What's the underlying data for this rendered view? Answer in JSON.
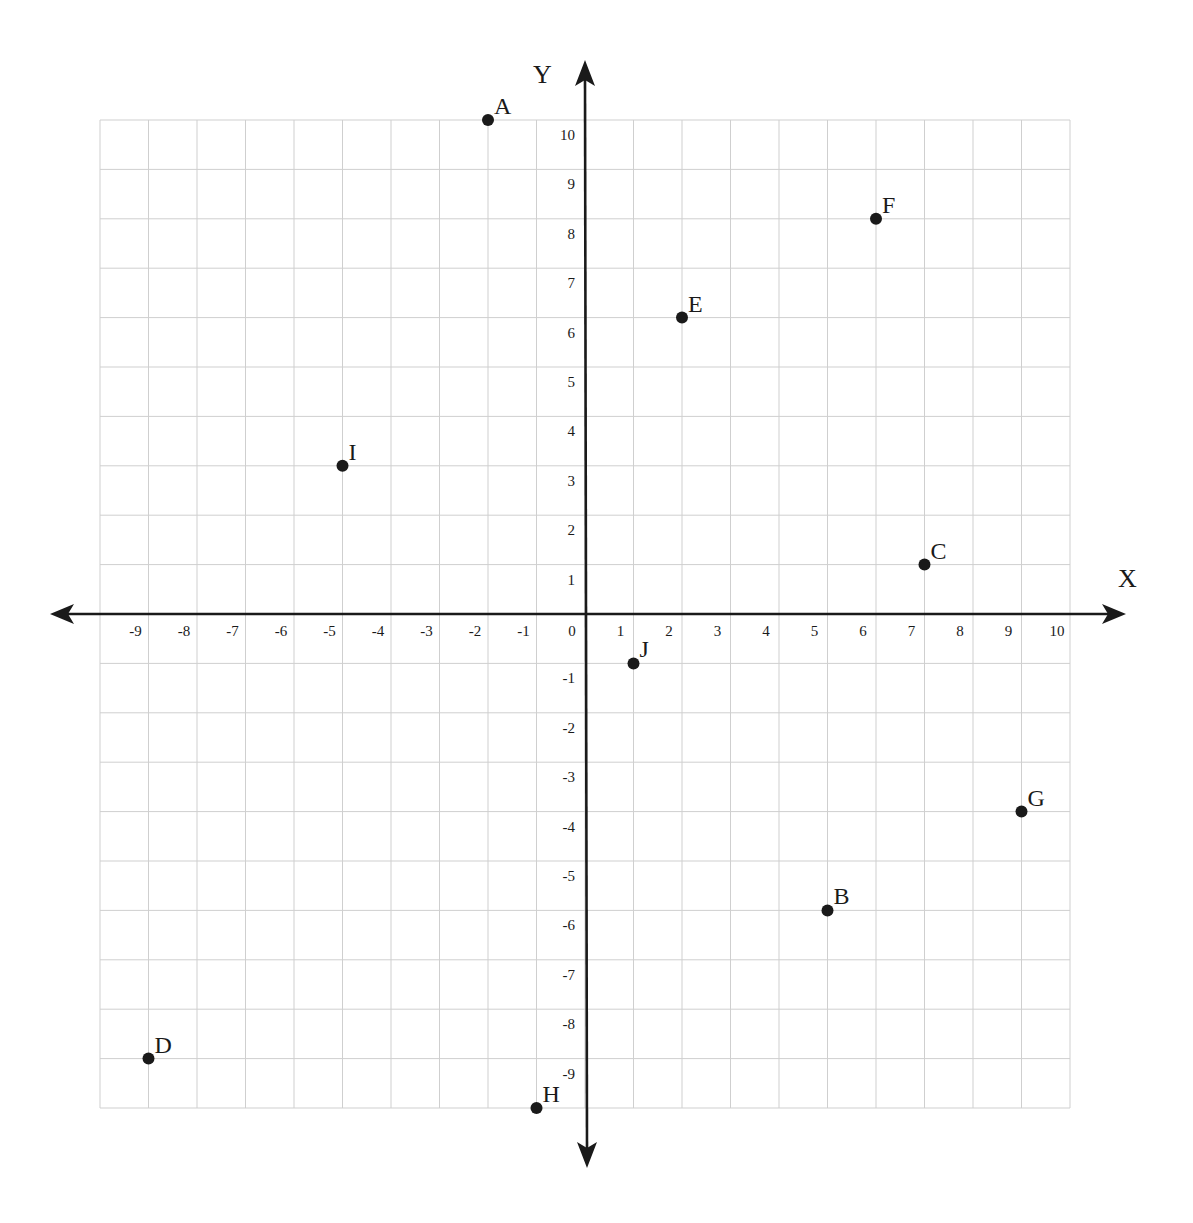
{
  "chart_data": {
    "type": "scatter",
    "title": "",
    "xlabel": "X",
    "ylabel": "Y",
    "xlim": [
      -10,
      10
    ],
    "ylim": [
      -10,
      10
    ],
    "grid": true,
    "legend": null,
    "x_ticks": [
      -9,
      -8,
      -7,
      -6,
      -5,
      -4,
      -3,
      -2,
      -1,
      0,
      1,
      2,
      3,
      4,
      5,
      6,
      7,
      8,
      9,
      10
    ],
    "y_ticks": [
      10,
      9,
      8,
      7,
      6,
      5,
      4,
      3,
      2,
      1,
      -1,
      -2,
      -3,
      -4,
      -5,
      -6,
      -7,
      -8,
      -9
    ],
    "points": [
      {
        "label": "A",
        "x": -2,
        "y": 10
      },
      {
        "label": "B",
        "x": 5,
        "y": -6
      },
      {
        "label": "C",
        "x": 7,
        "y": 1
      },
      {
        "label": "D",
        "x": -9,
        "y": -9
      },
      {
        "label": "E",
        "x": 2,
        "y": 6
      },
      {
        "label": "F",
        "x": 6,
        "y": 8
      },
      {
        "label": "G",
        "x": 9,
        "y": -4
      },
      {
        "label": "H",
        "x": -1,
        "y": -10
      },
      {
        "label": "I",
        "x": -5,
        "y": 3
      },
      {
        "label": "J",
        "x": 1,
        "y": -1
      }
    ]
  },
  "colors": {
    "grid": "#cfcfcf",
    "axis": "#1a1a1a",
    "point": "#1a1a1a",
    "background": "#ffffff"
  }
}
